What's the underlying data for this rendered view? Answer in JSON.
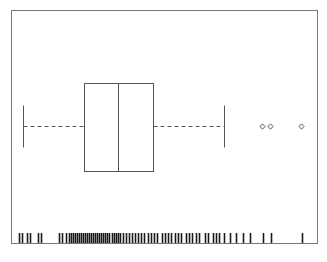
{
  "figure": {
    "width": 327,
    "height": 262,
    "background": "#ffffff",
    "line_color": "#555555",
    "frame_color": "#777777",
    "rug_color": "#1a1a1a"
  },
  "axes": {
    "frame": {
      "x0": 11,
      "y0": 10,
      "x1": 317,
      "y1": 243
    },
    "show_ticks": false,
    "show_tick_labels": false,
    "show_grid": false,
    "xlabel": "",
    "ylabel": "",
    "title": ""
  },
  "chart_data": {
    "type": "box",
    "orientation": "horizontal",
    "title": "",
    "xlabel": "",
    "ylabel": "",
    "grid": false,
    "legend": null,
    "xlim": [
      11,
      317
    ],
    "axis_units": "pixels",
    "note": "Horizontal box-and-whisker plot with a rug / marginal tick strip along the bottom axis. No tick labels or axis text are rendered in the image; positions are given in pixel coordinates of the 327x262 figure.",
    "series": [
      {
        "name": "box-1",
        "center_y": 126,
        "whisker_low": 23,
        "q1": 84,
        "median": 118,
        "q3": 153,
        "whisker_high": 224,
        "box_top": 83,
        "box_bottom": 171,
        "cap_top": 105,
        "cap_bottom": 147,
        "whisker_style": "dashed",
        "box_fill": "none",
        "outliers": [
          262,
          270,
          301
        ],
        "outlier_marker": "diamond-open",
        "outlier_y": 126
      }
    ],
    "rug": {
      "name": "rug-ticks",
      "y_top": 233,
      "y_bottom": 243,
      "count": 78,
      "x_positions": [
        19,
        22,
        27,
        30,
        38,
        41,
        59,
        62,
        66,
        69,
        71,
        73,
        75,
        77,
        79,
        81,
        83,
        85,
        87,
        89,
        91,
        93,
        95,
        97,
        99,
        101,
        103,
        105,
        107,
        109,
        112,
        114,
        116,
        118,
        120,
        123,
        126,
        129,
        132,
        135,
        138,
        141,
        144,
        148,
        151,
        154,
        157,
        162,
        165,
        168,
        171,
        175,
        178,
        181,
        186,
        189,
        192,
        196,
        199,
        205,
        208,
        213,
        216,
        219,
        224,
        230,
        236,
        243,
        250,
        263,
        271,
        302
      ]
    }
  }
}
